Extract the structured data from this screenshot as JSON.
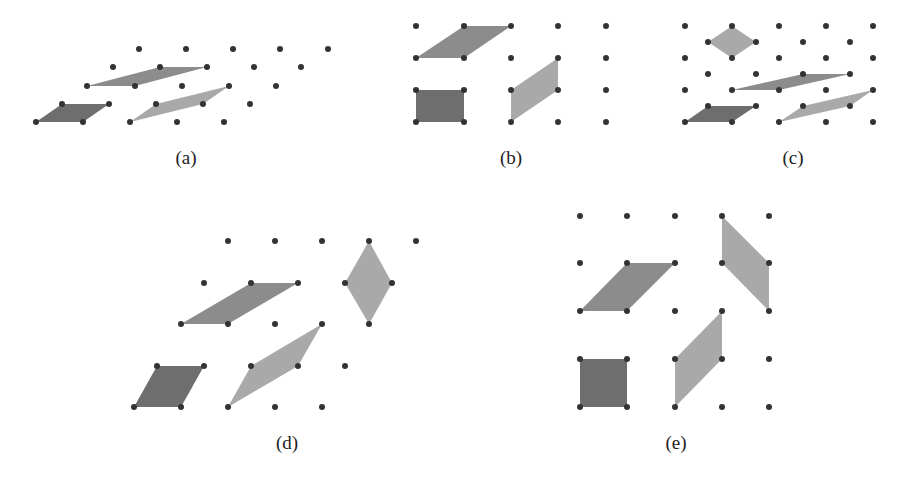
{
  "figure": {
    "colors": {
      "background": "#ffffff",
      "dot": "#333333",
      "cell_dark": "#6e6e6e",
      "cell_medium": "#8c8c8c",
      "cell_light": "#a9a9a9",
      "label": "#222222"
    },
    "dot_radius": 3,
    "panels": [
      {
        "id": "a",
        "label": "(a)",
        "lattice_type": "oblique",
        "label_pos": [
          186,
          158
        ],
        "dots": [
          [
            139,
            49
          ],
          [
            186,
            49
          ],
          [
            233,
            49
          ],
          [
            280,
            49
          ],
          [
            328,
            49
          ],
          [
            113,
            67
          ],
          [
            160,
            67
          ],
          [
            207,
            67
          ],
          [
            254,
            67
          ],
          [
            301,
            67
          ],
          [
            87,
            86
          ],
          [
            135,
            86
          ],
          [
            182,
            86
          ],
          [
            229,
            86
          ],
          [
            276,
            86
          ],
          [
            62,
            104
          ],
          [
            109,
            104
          ],
          [
            156,
            104
          ],
          [
            203,
            104
          ],
          [
            250,
            104
          ],
          [
            36,
            122
          ],
          [
            83,
            122
          ],
          [
            130,
            122
          ],
          [
            177,
            122
          ],
          [
            224,
            122
          ]
        ],
        "cells": [
          {
            "shade": "cell_dark",
            "points": [
              [
                36,
                122
              ],
              [
                83,
                122
              ],
              [
                109,
                104
              ],
              [
                62,
                104
              ]
            ]
          },
          {
            "shade": "cell_medium",
            "points": [
              [
                87,
                86
              ],
              [
                135,
                86
              ],
              [
                207,
                67
              ],
              [
                160,
                67
              ]
            ]
          },
          {
            "shade": "cell_light",
            "points": [
              [
                130,
                122
              ],
              [
                203,
                104
              ],
              [
                229,
                86
              ],
              [
                156,
                104
              ]
            ]
          }
        ]
      },
      {
        "id": "b",
        "label": "(b)",
        "lattice_type": "rectangular",
        "label_pos": [
          511,
          158
        ],
        "dots": [
          [
            416,
            26
          ],
          [
            464,
            26
          ],
          [
            511,
            26
          ],
          [
            558,
            26
          ],
          [
            606,
            26
          ],
          [
            416,
            58
          ],
          [
            464,
            58
          ],
          [
            511,
            58
          ],
          [
            558,
            58
          ],
          [
            606,
            58
          ],
          [
            416,
            90
          ],
          [
            464,
            90
          ],
          [
            511,
            90
          ],
          [
            558,
            90
          ],
          [
            606,
            90
          ],
          [
            416,
            122
          ],
          [
            464,
            122
          ],
          [
            511,
            122
          ],
          [
            558,
            122
          ],
          [
            606,
            122
          ]
        ],
        "cells": [
          {
            "shade": "cell_dark",
            "points": [
              [
                416,
                90
              ],
              [
                464,
                90
              ],
              [
                464,
                122
              ],
              [
                416,
                122
              ]
            ]
          },
          {
            "shade": "cell_medium",
            "points": [
              [
                416,
                58
              ],
              [
                464,
                58
              ],
              [
                511,
                26
              ],
              [
                464,
                26
              ]
            ]
          },
          {
            "shade": "cell_light",
            "points": [
              [
                511,
                90
              ],
              [
                558,
                58
              ],
              [
                558,
                90
              ],
              [
                511,
                122
              ]
            ]
          }
        ]
      },
      {
        "id": "c",
        "label": "(c)",
        "lattice_type": "centered-rectangular",
        "label_pos": [
          793,
          158
        ],
        "dots": [
          [
            685,
            26
          ],
          [
            732,
            26
          ],
          [
            779,
            26
          ],
          [
            826,
            26
          ],
          [
            873,
            26
          ],
          [
            708,
            42
          ],
          [
            756,
            42
          ],
          [
            803,
            42
          ],
          [
            850,
            42
          ],
          [
            685,
            58
          ],
          [
            732,
            58
          ],
          [
            779,
            58
          ],
          [
            826,
            58
          ],
          [
            873,
            58
          ],
          [
            708,
            74
          ],
          [
            756,
            74
          ],
          [
            803,
            74
          ],
          [
            850,
            74
          ],
          [
            685,
            90
          ],
          [
            732,
            90
          ],
          [
            779,
            90
          ],
          [
            826,
            90
          ],
          [
            873,
            90
          ],
          [
            708,
            106
          ],
          [
            756,
            106
          ],
          [
            803,
            106
          ],
          [
            850,
            106
          ],
          [
            685,
            122
          ],
          [
            732,
            122
          ],
          [
            779,
            122
          ],
          [
            826,
            122
          ],
          [
            873,
            122
          ]
        ],
        "cells": [
          {
            "shade": "cell_light",
            "points": [
              [
                732,
                26
              ],
              [
                756,
                42
              ],
              [
                732,
                58
              ],
              [
                708,
                42
              ]
            ]
          },
          {
            "shade": "cell_medium",
            "points": [
              [
                732,
                90
              ],
              [
                779,
                90
              ],
              [
                850,
                74
              ],
              [
                803,
                74
              ]
            ]
          },
          {
            "shade": "cell_dark",
            "points": [
              [
                685,
                122
              ],
              [
                732,
                122
              ],
              [
                756,
                106
              ],
              [
                708,
                106
              ]
            ]
          },
          {
            "shade": "cell_light",
            "points": [
              [
                779,
                122
              ],
              [
                850,
                106
              ],
              [
                873,
                90
              ],
              [
                803,
                106
              ]
            ]
          }
        ]
      },
      {
        "id": "d",
        "label": "(d)",
        "lattice_type": "hexagonal",
        "label_pos": [
          287,
          443
        ],
        "dots": [
          [
            228,
            241
          ],
          [
            275,
            241
          ],
          [
            322,
            241
          ],
          [
            369,
            241
          ],
          [
            416,
            241
          ],
          [
            204,
            283
          ],
          [
            251,
            283
          ],
          [
            298,
            283
          ],
          [
            345,
            283
          ],
          [
            392,
            283
          ],
          [
            181,
            324
          ],
          [
            228,
            324
          ],
          [
            275,
            324
          ],
          [
            322,
            324
          ],
          [
            369,
            324
          ],
          [
            157,
            366
          ],
          [
            204,
            366
          ],
          [
            251,
            366
          ],
          [
            298,
            366
          ],
          [
            345,
            366
          ],
          [
            134,
            407
          ],
          [
            181,
            407
          ],
          [
            228,
            407
          ],
          [
            275,
            407
          ],
          [
            322,
            407
          ]
        ],
        "cells": [
          {
            "shade": "cell_dark",
            "points": [
              [
                134,
                407
              ],
              [
                181,
                407
              ],
              [
                204,
                366
              ],
              [
                157,
                366
              ]
            ]
          },
          {
            "shade": "cell_medium",
            "points": [
              [
                181,
                324
              ],
              [
                228,
                324
              ],
              [
                298,
                283
              ],
              [
                251,
                283
              ]
            ]
          },
          {
            "shade": "cell_light",
            "points": [
              [
                228,
                407
              ],
              [
                298,
                366
              ],
              [
                322,
                324
              ],
              [
                251,
                366
              ]
            ]
          },
          {
            "shade": "cell_light",
            "points": [
              [
                369,
                241
              ],
              [
                392,
                283
              ],
              [
                369,
                324
              ],
              [
                345,
                283
              ]
            ]
          }
        ]
      },
      {
        "id": "e",
        "label": "(e)",
        "lattice_type": "square",
        "label_pos": [
          676,
          443
        ],
        "dots": [
          [
            580,
            216
          ],
          [
            627,
            216
          ],
          [
            675,
            216
          ],
          [
            722,
            216
          ],
          [
            769,
            216
          ],
          [
            580,
            263
          ],
          [
            627,
            263
          ],
          [
            675,
            263
          ],
          [
            722,
            263
          ],
          [
            769,
            263
          ],
          [
            580,
            311
          ],
          [
            627,
            311
          ],
          [
            675,
            311
          ],
          [
            722,
            311
          ],
          [
            769,
            311
          ],
          [
            580,
            359
          ],
          [
            627,
            359
          ],
          [
            675,
            359
          ],
          [
            722,
            359
          ],
          [
            769,
            359
          ],
          [
            580,
            407
          ],
          [
            627,
            407
          ],
          [
            675,
            407
          ],
          [
            722,
            407
          ],
          [
            769,
            407
          ]
        ],
        "cells": [
          {
            "shade": "cell_dark",
            "points": [
              [
                580,
                359
              ],
              [
                627,
                359
              ],
              [
                627,
                407
              ],
              [
                580,
                407
              ]
            ]
          },
          {
            "shade": "cell_medium",
            "points": [
              [
                580,
                311
              ],
              [
                627,
                311
              ],
              [
                675,
                263
              ],
              [
                627,
                263
              ]
            ]
          },
          {
            "shade": "cell_light",
            "points": [
              [
                675,
                407
              ],
              [
                675,
                359
              ],
              [
                722,
                311
              ],
              [
                722,
                359
              ]
            ]
          },
          {
            "shade": "cell_light",
            "points": [
              [
                722,
                216
              ],
              [
                769,
                263
              ],
              [
                769,
                311
              ],
              [
                722,
                263
              ]
            ]
          }
        ]
      }
    ]
  }
}
